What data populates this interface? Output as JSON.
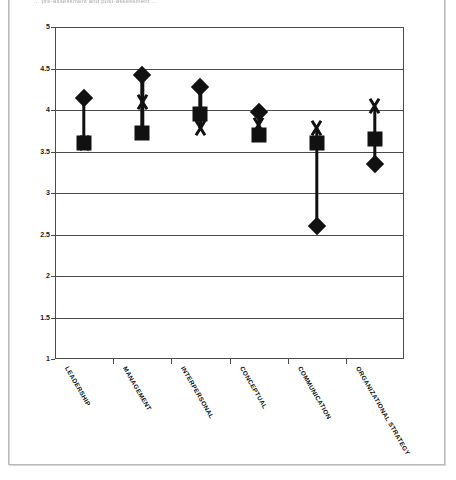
{
  "page": {
    "caption_text": "... pre-assessment and post-assessment ..."
  },
  "chart_data": {
    "type": "scatter",
    "title": "",
    "subtitle": "",
    "xlabel": "",
    "ylabel": "",
    "ylim": [
      1,
      5
    ],
    "ystep": 0.5,
    "grid": true,
    "legend_position": "none",
    "categories": [
      "LEADERSHIP",
      "MANAGEMENT",
      "INTERPERSONAL",
      "CONCEPTUAL",
      "COMMUNICATION",
      "ORGANIZATIONAL STRATEGY"
    ],
    "ytick_labels": [
      "5",
      "4.5",
      "4",
      "3.5",
      "3",
      "2.5",
      "2",
      "1.5",
      "1"
    ],
    "ytick_values": [
      5,
      4.5,
      4,
      3.5,
      3,
      2.5,
      2,
      1.5,
      1
    ],
    "series": [
      {
        "name": "diamond",
        "marker": "diamond",
        "color": "#111111",
        "values": [
          4.15,
          4.42,
          4.28,
          3.98,
          2.6,
          3.35
        ]
      },
      {
        "name": "square",
        "marker": "square",
        "color": "#111111",
        "values": [
          3.6,
          3.72,
          3.95,
          3.7,
          3.6,
          3.65
        ]
      },
      {
        "name": "cross",
        "marker": "x",
        "color": "#111111",
        "values": [
          3.6,
          4.1,
          3.78,
          3.82,
          3.78,
          4.05
        ]
      }
    ]
  }
}
